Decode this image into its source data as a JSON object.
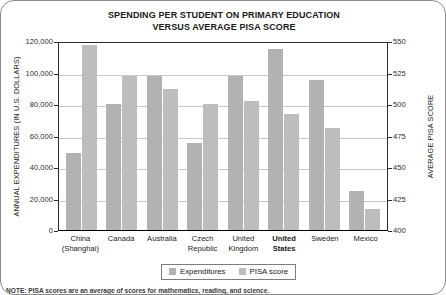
{
  "note": "NOTE: PISA scores are an average of scores for mathematics, reading, and science.",
  "legend": {
    "expenditures_label": "Expenditures",
    "pisa_label": "PISA score",
    "expenditures_color": "#b2b2b2",
    "pisa_color": "#bdbdbd"
  },
  "chart_data": {
    "type": "bar",
    "title": "SPENDING PER STUDENT ON PRIMARY EDUCATION VERSUS AVERAGE PISA SCORE",
    "title_line1": "SPENDING PER STUDENT ON PRIMARY EDUCATION",
    "title_line2": "VERSUS AVERAGE PISA SCORE",
    "xlabel": "",
    "ylabel": "ANNUAL EXPENDITURES (IN U.S. DOLLARS)",
    "ylabel_right": "AVERAGE PISA SCORE",
    "categories": [
      "China (Shanghai)",
      "Canada",
      "Australia",
      "Czech Republic",
      "United Kingdom",
      "United States",
      "Sweden",
      "Mexico"
    ],
    "category_lines": [
      [
        "China",
        "(Shanghai)"
      ],
      [
        "Canada",
        ""
      ],
      [
        "Australia",
        ""
      ],
      [
        "Czech",
        "Republic"
      ],
      [
        "United",
        "Kingdom"
      ],
      [
        "United",
        "States"
      ],
      [
        "Sweden",
        ""
      ],
      [
        "Mexico",
        ""
      ]
    ],
    "highlighted_category": "United States",
    "ylim": [
      0,
      120000
    ],
    "ylim_right": [
      400,
      550
    ],
    "yticks": [
      0,
      20000,
      40000,
      60000,
      80000,
      100000,
      120000
    ],
    "ytick_labels": [
      "0",
      "20,000",
      "40,000",
      "60,000",
      "80,000",
      "100,000",
      "120,000"
    ],
    "yticks_right": [
      400,
      425,
      450,
      475,
      500,
      525,
      550
    ],
    "ytick_labels_right": [
      "400",
      "425",
      "450",
      "475",
      "500",
      "525",
      "550"
    ],
    "grid": true,
    "legend_position": "bottom",
    "series": [
      {
        "name": "Expenditures",
        "axis": "left",
        "unit": "U.S. dollars",
        "values": [
          49000,
          80000,
          97500,
          55000,
          97500,
          115000,
          95000,
          25000
        ]
      },
      {
        "name": "PISA score",
        "axis": "right",
        "unit": "score",
        "values": [
          547,
          522,
          512,
          500,
          502,
          492,
          481,
          417
        ]
      }
    ]
  }
}
